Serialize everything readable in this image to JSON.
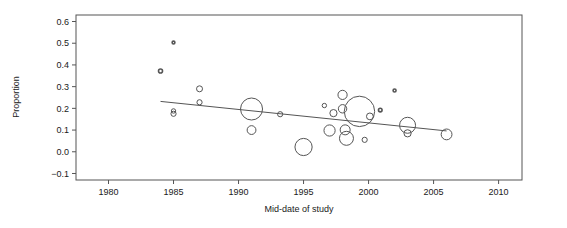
{
  "chart_data": {
    "type": "scatter",
    "title": "",
    "xlabel": "Mid-date of study",
    "ylabel": "Proportion",
    "xlim": [
      1977.5,
      2011.8
    ],
    "ylim": [
      -0.13,
      0.63
    ],
    "xticks": [
      1980,
      1985,
      1990,
      1995,
      2000,
      2005,
      2010
    ],
    "xticklabels": [
      "1980",
      "1985",
      "1990",
      "1995",
      "2000",
      "2005",
      "2010"
    ],
    "yticks": [
      -0.1,
      0.0,
      0.1,
      0.2,
      0.3,
      0.4,
      0.5,
      0.6
    ],
    "yticklabels": [
      "-0.1",
      "0.0",
      "0.1",
      "0.2",
      "0.3",
      "0.4",
      "0.5",
      "0.6"
    ],
    "grid": false,
    "legend": null,
    "marker": "open-circle",
    "bubble_note": "Marker radius proportional to study weight/precision",
    "points": [
      {
        "x": 1984.0,
        "y": 0.372,
        "r": 2.0
      },
      {
        "x": 1985.0,
        "y": 0.503,
        "r": 1.4
      },
      {
        "x": 1985.0,
        "y": 0.188,
        "r": 2.2
      },
      {
        "x": 1985.0,
        "y": 0.175,
        "r": 2.6
      },
      {
        "x": 1987.0,
        "y": 0.29,
        "r": 3.0
      },
      {
        "x": 1987.0,
        "y": 0.228,
        "r": 2.6
      },
      {
        "x": 1991.0,
        "y": 0.197,
        "r": 11.0
      },
      {
        "x": 1991.0,
        "y": 0.1,
        "r": 4.4
      },
      {
        "x": 1993.2,
        "y": 0.173,
        "r": 2.6
      },
      {
        "x": 1995.0,
        "y": 0.022,
        "r": 8.6
      },
      {
        "x": 1996.6,
        "y": 0.213,
        "r": 2.2
      },
      {
        "x": 1997.0,
        "y": 0.098,
        "r": 5.6
      },
      {
        "x": 1997.3,
        "y": 0.178,
        "r": 3.6
      },
      {
        "x": 1998.0,
        "y": 0.262,
        "r": 4.6
      },
      {
        "x": 1998.0,
        "y": 0.198,
        "r": 4.2
      },
      {
        "x": 1998.2,
        "y": 0.101,
        "r": 5.0
      },
      {
        "x": 1998.3,
        "y": 0.062,
        "r": 7.0
      },
      {
        "x": 1999.3,
        "y": 0.186,
        "r": 15.2
      },
      {
        "x": 1999.7,
        "y": 0.055,
        "r": 2.6
      },
      {
        "x": 2000.1,
        "y": 0.163,
        "r": 3.4
      },
      {
        "x": 2000.9,
        "y": 0.192,
        "r": 1.8
      },
      {
        "x": 2002.0,
        "y": 0.282,
        "r": 1.5
      },
      {
        "x": 2003.0,
        "y": 0.122,
        "r": 8.0
      },
      {
        "x": 2003.0,
        "y": 0.085,
        "r": 3.6
      },
      {
        "x": 2006.0,
        "y": 0.08,
        "r": 5.4
      }
    ],
    "regression_line": {
      "x_start": 1984.0,
      "y_start": 0.232,
      "x_end": 2006.0,
      "y_end": 0.096,
      "slope_per_year": -0.0062,
      "color": "#555555"
    },
    "style": {
      "frame_color": "#555555",
      "marker_edge_color": "#555555",
      "text_color": "#1a1a1a",
      "background": "#ffffff"
    }
  }
}
